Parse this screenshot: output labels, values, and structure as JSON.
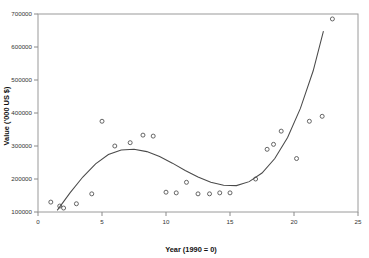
{
  "chart_data": {
    "type": "scatter",
    "title": "",
    "xlabel": "Year (1990 = 0)",
    "ylabel": "Value ('000 US $)",
    "xlim": [
      0,
      25
    ],
    "ylim": [
      100000,
      700000
    ],
    "xticks": [
      0,
      5,
      10,
      15,
      20,
      25
    ],
    "yticks": [
      100000,
      200000,
      300000,
      400000,
      500000,
      600000,
      700000
    ],
    "xticklabels": [
      "0",
      "5",
      "10",
      "15",
      "20",
      "25"
    ],
    "yticklabels": [
      "100000",
      "200000",
      "300000",
      "400000",
      "500000",
      "600000",
      "700000"
    ],
    "grid": false,
    "legend": null,
    "marker": "open-circle",
    "marker_color": "#555555",
    "line_color": "#4a4a4a",
    "series": [
      {
        "name": "observations",
        "type": "scatter",
        "x": [
          1.0,
          1.7,
          2.0,
          3.0,
          4.2,
          5.0,
          6.0,
          7.2,
          8.2,
          9.0,
          10.0,
          10.8,
          11.6,
          12.5,
          13.4,
          14.2,
          15.0,
          17.0,
          17.9,
          18.4,
          19.0,
          20.2,
          21.2,
          22.2,
          23.0
        ],
        "y": [
          130000,
          118000,
          112000,
          125000,
          155000,
          375000,
          300000,
          310000,
          333000,
          330000,
          160000,
          158000,
          190000,
          155000,
          155000,
          158000,
          158000,
          200000,
          290000,
          305000,
          345000,
          262000,
          375000,
          390000,
          685000
        ]
      },
      {
        "name": "fitted-cubic-trend",
        "type": "line",
        "x": [
          1.5,
          2.5,
          3.5,
          4.5,
          5.5,
          6.5,
          7.5,
          8.5,
          9.5,
          10.5,
          11.5,
          12.5,
          13.5,
          14.5,
          15.5,
          16.5,
          17.5,
          18.5,
          19.5,
          20.5,
          21.5,
          22.3
        ],
        "y": [
          105000,
          158000,
          206000,
          246000,
          274000,
          288000,
          290000,
          283000,
          268000,
          248000,
          226000,
          206000,
          190000,
          181000,
          180000,
          192000,
          218000,
          262000,
          326000,
          414000,
          528000,
          648000
        ]
      }
    ]
  },
  "plot": {
    "axis_tick_color": "#8a8a8a",
    "frame_color": "#9a9a9a",
    "background": "#ffffff"
  }
}
